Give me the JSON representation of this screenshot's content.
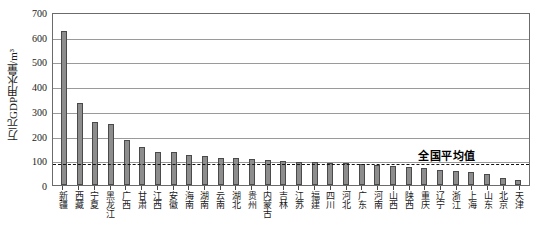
{
  "chart_data": {
    "type": "bar",
    "title": "",
    "xlabel": "",
    "ylabel": "万元GDP用水量/m³",
    "ylim": [
      0,
      700
    ],
    "yticks": [
      0,
      100,
      200,
      300,
      400,
      500,
      600,
      700
    ],
    "grid": true,
    "legend": "none",
    "categories": [
      "新疆",
      "西藏",
      "宁夏",
      "黑龙江",
      "广西",
      "甘肃",
      "江西",
      "安徽",
      "海南",
      "湖南",
      "云南",
      "湖北",
      "贵州",
      "内蒙古",
      "吉林",
      "江苏",
      "福建",
      "四川",
      "河北",
      "广东",
      "河南",
      "山西",
      "陕西",
      "重庆",
      "辽宁",
      "浙江",
      "上海",
      "山东",
      "北京",
      "天津"
    ],
    "values": [
      625,
      330,
      253,
      245,
      182,
      152,
      135,
      132,
      120,
      118,
      110,
      108,
      105,
      100,
      98,
      95,
      92,
      90,
      88,
      85,
      80,
      76,
      72,
      68,
      62,
      58,
      52,
      45,
      28,
      22
    ],
    "annotations": [
      {
        "name": "national-average",
        "label": "全国平均值",
        "value": 93,
        "style": "dashed-horizontal-line"
      }
    ]
  }
}
